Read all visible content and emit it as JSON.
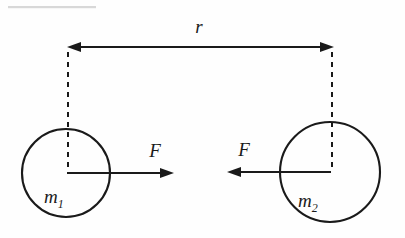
{
  "figure": {
    "background_color": "#fefefe",
    "ink_color": "#1a1a1a",
    "labels": {
      "distance": "r",
      "force_left": "F",
      "force_right": "F",
      "mass_left_symbol": "m",
      "mass_left_subscript": "1",
      "mass_right_symbol": "m",
      "mass_right_subscript": "2"
    },
    "bodies": [
      {
        "name": "mass-1",
        "label": "m",
        "subscript": "1",
        "center_x": 66,
        "center_y": 173,
        "radius": 44
      },
      {
        "name": "mass-2",
        "label": "m",
        "subscript": "2",
        "center_x": 330,
        "center_y": 172,
        "radius": 50
      }
    ],
    "separation": {
      "name": "r",
      "line_y": 47,
      "from_x": 68,
      "to_x": 333,
      "double_headed": true
    },
    "forces": [
      {
        "name": "force-on-mass-1",
        "label": "F",
        "direction": "right",
        "tail_x": 66,
        "tip_x": 172,
        "y": 173
      },
      {
        "name": "force-on-mass-2",
        "label": "F",
        "direction": "left",
        "tail_x": 330,
        "tip_x": 228,
        "y": 172
      }
    ]
  }
}
